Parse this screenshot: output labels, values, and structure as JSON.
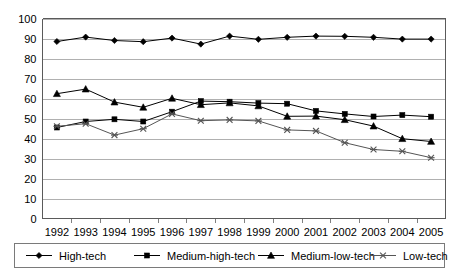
{
  "chart_data": {
    "type": "line",
    "title": "",
    "subtitle": "",
    "xlabel": "",
    "ylabel": "",
    "categories": [
      "1992",
      "1993",
      "1994",
      "1995",
      "1996",
      "1997",
      "1998",
      "1999",
      "2000",
      "2001",
      "2002",
      "2003",
      "2004",
      "2005"
    ],
    "x": [
      1992,
      1993,
      1994,
      1995,
      1996,
      1997,
      1998,
      1999,
      2000,
      2001,
      2002,
      2003,
      2004,
      2005
    ],
    "ylim": [
      0,
      100
    ],
    "ytick_values": [
      0,
      10,
      20,
      30,
      40,
      50,
      60,
      70,
      80,
      90,
      100
    ],
    "ytick_labels": [
      "0",
      "10",
      "20",
      "30",
      "40",
      "50",
      "60",
      "70",
      "80",
      "90",
      "100"
    ],
    "grid": true,
    "grid_axis": "y",
    "legend_position": "bottom",
    "series": [
      {
        "name": "High-tech",
        "marker": "diamond",
        "color": "#000000",
        "values": [
          88.5,
          90.7,
          89.0,
          88.4,
          90.2,
          87.2,
          91.2,
          89.6,
          90.6,
          91.2,
          91.1,
          90.6,
          89.7,
          89.7
        ]
      },
      {
        "name": "Medium-high-tech",
        "marker": "square",
        "color": "#000000",
        "values": [
          45.5,
          48.5,
          49.6,
          48.5,
          53.4,
          58.7,
          58.4,
          57.7,
          57.4,
          53.8,
          52.3,
          51.0,
          51.7,
          50.9
        ]
      },
      {
        "name": "Medium-low-tech",
        "marker": "triangle",
        "color": "#000000",
        "values": [
          62.4,
          64.7,
          58.2,
          55.6,
          60.1,
          56.9,
          57.8,
          56.3,
          51.1,
          51.2,
          49.4,
          46.2,
          39.9,
          38.5
        ]
      },
      {
        "name": "Low-tech",
        "marker": "x",
        "color": "#555555",
        "values": [
          46.1,
          47.4,
          41.7,
          44.9,
          52.3,
          48.9,
          49.3,
          48.8,
          44.3,
          43.8,
          37.9,
          34.5,
          33.6,
          30.4
        ]
      }
    ],
    "legend_entries": [
      {
        "label": "High-tech",
        "marker": "diamond"
      },
      {
        "label": "Medium-high-tech",
        "marker": "square"
      },
      {
        "label": "Medium-low-tech",
        "marker": "triangle"
      },
      {
        "label": "Low-tech",
        "marker": "x"
      }
    ]
  }
}
